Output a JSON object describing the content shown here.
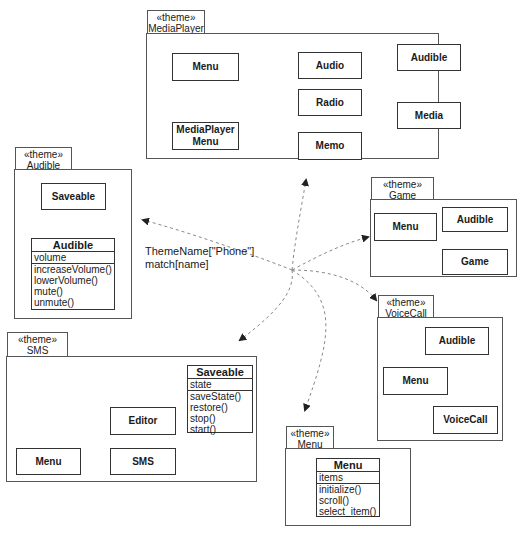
{
  "stereotype": "«theme»",
  "central_note": {
    "line1": "ThemeName[\"Phone\"]",
    "line2": "match[name]"
  },
  "packages": {
    "mediaplayer": {
      "name": "MediaPlayer",
      "classes": {
        "menu": "Menu",
        "mediaplayer_menu_l1": "MediaPlayer",
        "mediaplayer_menu_l2": "Menu",
        "audio": "Audio",
        "radio": "Radio",
        "memo": "Memo",
        "audible": "Audible",
        "media": "Media"
      }
    },
    "audible": {
      "name": "Audible",
      "classes": {
        "saveable": "Saveable",
        "audible": {
          "name": "Audible",
          "attributes": [
            "volume"
          ],
          "operations": [
            "increaseVolume()",
            "lowerVolume()",
            "mute()",
            "unmute()"
          ]
        }
      }
    },
    "game": {
      "name": "Game",
      "classes": {
        "menu": "Menu",
        "audible": "Audible",
        "game": "Game"
      }
    },
    "voicecall": {
      "name": "VoiceCall",
      "classes": {
        "audible": "Audible",
        "menu": "Menu",
        "voicecall": "VoiceCall"
      }
    },
    "sms": {
      "name": "SMS",
      "classes": {
        "saveable": {
          "name": "Saveable",
          "attributes": [
            "state"
          ],
          "operations": [
            "saveState()",
            "restore()",
            "stop()",
            "start()"
          ]
        },
        "editor": "Editor",
        "menu": "Menu",
        "sms": "SMS"
      }
    },
    "menu": {
      "name": "Menu",
      "classes": {
        "menu": {
          "name": "Menu",
          "attributes": [
            "items"
          ],
          "operations": [
            "initialize()",
            "scroll()",
            "select_item()"
          ]
        }
      }
    }
  },
  "colors": {
    "line": "#333333",
    "dashed": "#888888",
    "border": "#555555"
  }
}
